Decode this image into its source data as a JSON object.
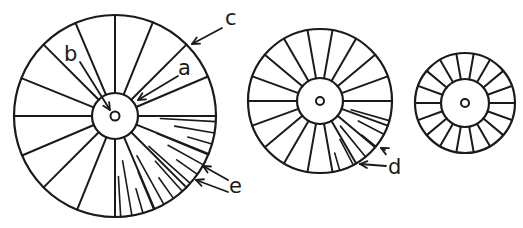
{
  "figure": {
    "ink_color": "#1a1a1a",
    "background": "#ffffff"
  },
  "labels": [
    {
      "id": "a",
      "text": "a",
      "x": 181,
      "y": 58
    },
    {
      "id": "b",
      "text": "b",
      "x": 66,
      "y": 46
    },
    {
      "id": "c",
      "text": "c",
      "x": 226,
      "y": 12
    },
    {
      "id": "d",
      "text": "d",
      "x": 388,
      "y": 160
    },
    {
      "id": "e",
      "text": "e",
      "x": 230,
      "y": 176
    }
  ],
  "discs": [
    {
      "name": "large",
      "cx": 115,
      "cy": 116,
      "r": 101,
      "hub_r": 23,
      "pit_r": 4.5,
      "spokes_deg": [
        0,
        22,
        45,
        67,
        90,
        112,
        135,
        157,
        180,
        202,
        225,
        247,
        270,
        292,
        315,
        337
      ],
      "fine_lines": {
        "from_deg": 0,
        "to_deg": 90,
        "count": 14
      }
    },
    {
      "name": "medium",
      "cx": 320,
      "cy": 101,
      "r": 72,
      "hub_r": 23,
      "pit_r": 4,
      "spokes_deg": [
        0,
        20,
        40,
        60,
        80,
        100,
        120,
        140,
        160,
        180,
        200,
        220,
        240,
        260,
        280,
        300,
        320,
        340
      ],
      "fine_lines": {
        "from_deg": 10,
        "to_deg": 80,
        "count": 6
      }
    },
    {
      "name": "small",
      "cx": 465,
      "cy": 103,
      "r": 50,
      "hub_r": 24,
      "pit_r": 4,
      "spokes_deg": [
        0,
        20,
        40,
        60,
        80,
        100,
        120,
        140,
        160,
        180,
        200,
        220,
        240,
        260,
        280,
        300,
        320,
        340
      ],
      "fine_lines": null
    }
  ],
  "arrows": [
    {
      "label": "a",
      "x1": 178,
      "y1": 76,
      "x2": 138,
      "y2": 100
    },
    {
      "label": "b",
      "x1": 80,
      "y1": 62,
      "x2": 110,
      "y2": 110
    },
    {
      "label": "c",
      "x1": 222,
      "y1": 28,
      "x2": 192,
      "y2": 44
    },
    {
      "label": "d1",
      "x1": 385,
      "y1": 150,
      "x2": 381,
      "y2": 148
    },
    {
      "label": "d2",
      "x1": 386,
      "y1": 166,
      "x2": 360,
      "y2": 164
    },
    {
      "label": "e1",
      "x1": 228,
      "y1": 180,
      "x2": 203,
      "y2": 166
    },
    {
      "label": "e2",
      "x1": 228,
      "y1": 192,
      "x2": 196,
      "y2": 180
    }
  ]
}
